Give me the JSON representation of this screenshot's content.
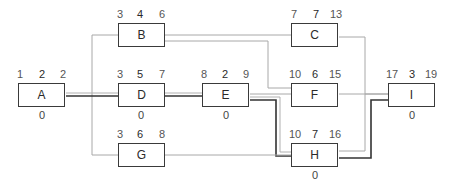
{
  "diagram": {
    "type": "activity-on-node network (critical path)",
    "legend_note": "Top labels: early start, duration, early finish; bottom label: slack (shown for critical activities)",
    "nodes": [
      {
        "id": "A",
        "label": "A",
        "es": "1",
        "dur": "2",
        "ef": "2",
        "slack": "0",
        "x": 18,
        "y": 83
      },
      {
        "id": "B",
        "label": "B",
        "es": "3",
        "dur": "4",
        "ef": "6",
        "slack": "",
        "x": 118,
        "y": 23
      },
      {
        "id": "C",
        "label": "C",
        "es": "7",
        "dur": "7",
        "ef": "13",
        "slack": "",
        "x": 291,
        "y": 23
      },
      {
        "id": "D",
        "label": "D",
        "es": "3",
        "dur": "5",
        "ef": "7",
        "slack": "0",
        "x": 118,
        "y": 83
      },
      {
        "id": "E",
        "label": "E",
        "es": "8",
        "dur": "2",
        "ef": "9",
        "slack": "0",
        "x": 202,
        "y": 83
      },
      {
        "id": "F",
        "label": "F",
        "es": "10",
        "dur": "6",
        "ef": "15",
        "slack": "",
        "x": 291,
        "y": 83
      },
      {
        "id": "G",
        "label": "G",
        "es": "3",
        "dur": "6",
        "ef": "8",
        "slack": "",
        "x": 118,
        "y": 143
      },
      {
        "id": "H",
        "label": "H",
        "es": "10",
        "dur": "7",
        "ef": "16",
        "slack": "0",
        "x": 291,
        "y": 143
      },
      {
        "id": "I",
        "label": "I",
        "es": "17",
        "dur": "3",
        "ef": "19",
        "slack": "0",
        "x": 388,
        "y": 83
      }
    ],
    "edges": [
      {
        "from": "A",
        "to": "B",
        "critical": false
      },
      {
        "from": "A",
        "to": "D",
        "critical": true
      },
      {
        "from": "A",
        "to": "G",
        "critical": false
      },
      {
        "from": "B",
        "to": "C",
        "critical": false
      },
      {
        "from": "B",
        "to": "F",
        "critical": false
      },
      {
        "from": "D",
        "to": "E",
        "critical": true
      },
      {
        "from": "E",
        "to": "F",
        "critical": false
      },
      {
        "from": "E",
        "to": "H",
        "critical": true
      },
      {
        "from": "G",
        "to": "H",
        "critical": false
      },
      {
        "from": "C",
        "to": "I",
        "critical": false
      },
      {
        "from": "F",
        "to": "I",
        "critical": false
      },
      {
        "from": "H",
        "to": "I",
        "critical": true
      }
    ],
    "colors": {
      "node_border": "#3a3a3a",
      "normal_edge": "#aaaaaa",
      "critical_edge": "#333333"
    }
  }
}
